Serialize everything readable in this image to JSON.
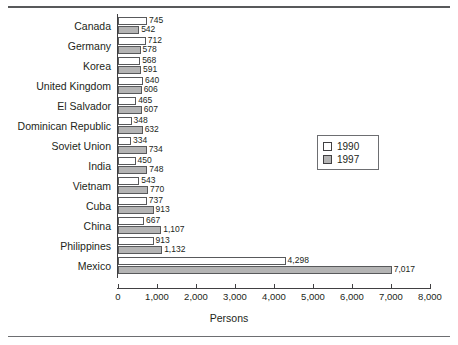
{
  "chart_data": {
    "type": "bar",
    "orientation": "horizontal",
    "title": "",
    "xlabel": "Persons",
    "ylabel": "",
    "xlim": [
      0,
      8000
    ],
    "xticks": [
      0,
      1000,
      2000,
      3000,
      4000,
      5000,
      6000,
      7000,
      8000
    ],
    "xtick_labels": [
      "0",
      "1,000",
      "2,000",
      "3,000",
      "4,000",
      "5,000",
      "6,000",
      "7,000",
      "8,000"
    ],
    "grid": false,
    "legend_position": "right-middle",
    "categories": [
      "Canada",
      "Germany",
      "Korea",
      "United Kingdom",
      "El Salvador",
      "Dominican Republic",
      "Soviet Union",
      "India",
      "Vietnam",
      "Cuba",
      "China",
      "Philippines",
      "Mexico"
    ],
    "series": [
      {
        "name": "1990",
        "color": "#ffffff",
        "values": [
          745,
          712,
          568,
          640,
          465,
          348,
          334,
          450,
          543,
          737,
          667,
          913,
          4298
        ],
        "labels": [
          "745",
          "712",
          "568",
          "640",
          "465",
          "348",
          "334",
          "450",
          "543",
          "737",
          "667",
          "913",
          "4,298"
        ]
      },
      {
        "name": "1997",
        "color": "#b4b4b4",
        "values": [
          542,
          578,
          591,
          606,
          607,
          632,
          734,
          748,
          770,
          913,
          1107,
          1132,
          7017
        ],
        "labels": [
          "542",
          "578",
          "591",
          "606",
          "607",
          "632",
          "734",
          "748",
          "770",
          "913",
          "1,107",
          "1,132",
          "7,017"
        ]
      }
    ]
  },
  "legend": {
    "items": [
      {
        "label": "1990",
        "swatch": "white-square-icon"
      },
      {
        "label": "1997",
        "swatch": "gray-square-icon"
      }
    ]
  }
}
